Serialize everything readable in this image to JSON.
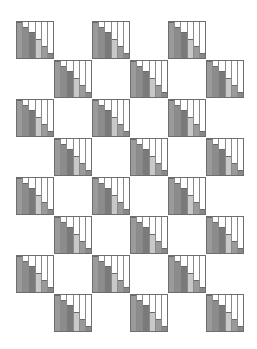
{
  "pattern": {
    "tile_size": 38,
    "bar_heights_pct": [
      100,
      87,
      72,
      52,
      33,
      14
    ],
    "bar_colors": [
      "#9a9a9a",
      "#8c8c8c",
      "#7a7a7a",
      "#c8c8c8",
      "#9a9a9a",
      "#888888"
    ],
    "tiles": [
      {
        "x": 16,
        "y": 21
      },
      {
        "x": 92,
        "y": 21
      },
      {
        "x": 168,
        "y": 21
      },
      {
        "x": 54,
        "y": 60
      },
      {
        "x": 130,
        "y": 60
      },
      {
        "x": 206,
        "y": 60
      },
      {
        "x": 16,
        "y": 99
      },
      {
        "x": 92,
        "y": 99
      },
      {
        "x": 168,
        "y": 99
      },
      {
        "x": 54,
        "y": 138
      },
      {
        "x": 130,
        "y": 138
      },
      {
        "x": 206,
        "y": 138
      },
      {
        "x": 16,
        "y": 177
      },
      {
        "x": 92,
        "y": 177
      },
      {
        "x": 168,
        "y": 177
      },
      {
        "x": 54,
        "y": 216
      },
      {
        "x": 130,
        "y": 216
      },
      {
        "x": 206,
        "y": 216
      },
      {
        "x": 16,
        "y": 255
      },
      {
        "x": 92,
        "y": 255
      },
      {
        "x": 168,
        "y": 255
      },
      {
        "x": 54,
        "y": 294
      },
      {
        "x": 130,
        "y": 294
      },
      {
        "x": 206,
        "y": 294
      }
    ]
  }
}
